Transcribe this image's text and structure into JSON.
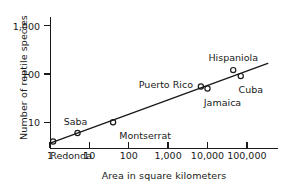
{
  "chart_data": {
    "type": "scatter",
    "title": "",
    "xlabel": "Area in square kilometers",
    "ylabel": "Number of reptile species",
    "xscale": "log",
    "yscale": "log",
    "xlim": [
      1,
      600000
    ],
    "ylim": [
      3,
      1500
    ],
    "grid": false,
    "legend": "none",
    "xticks": [
      {
        "value": 1,
        "label": "1"
      },
      {
        "value": 10,
        "label": "10"
      },
      {
        "value": 100,
        "label": "100"
      },
      {
        "value": 1000,
        "label": "1,000"
      },
      {
        "value": 10000,
        "label": "10,000"
      },
      {
        "value": 100000,
        "label": "100,000"
      }
    ],
    "yticks": [
      {
        "value": 10,
        "label": "10"
      },
      {
        "value": 100,
        "label": "100"
      },
      {
        "value": 1000,
        "label": "1,000"
      }
    ],
    "series": [
      {
        "name": "West Indies islands",
        "marker": "open-circle",
        "points": [
          {
            "label": "Redonda",
            "x": 1.2,
            "y": 4,
            "label_dx": 18,
            "label_dy": 13
          },
          {
            "label": "Saba",
            "x": 5,
            "y": 6,
            "label_dx": -2,
            "label_dy": -12
          },
          {
            "label": "Montserrat",
            "x": 40,
            "y": 10,
            "label_dx": 32,
            "label_dy": 13
          },
          {
            "label": "Puerto Rico",
            "x": 6800,
            "y": 55,
            "label_dx": -35,
            "label_dy": -2
          },
          {
            "label": "Jamaica",
            "x": 10000,
            "y": 50,
            "label_dx": 15,
            "label_dy": 14
          },
          {
            "label": "Hispaniola",
            "x": 45000,
            "y": 120,
            "label_dx": 0,
            "label_dy": -13
          },
          {
            "label": "Cuba",
            "x": 70000,
            "y": 90,
            "label_dx": 10,
            "label_dy": 13
          }
        ]
      }
    ],
    "trendline": {
      "name": "species-area regression",
      "x_start": 1.05,
      "y_start": 3.75,
      "x_end": 340000,
      "y_end": 165
    }
  }
}
